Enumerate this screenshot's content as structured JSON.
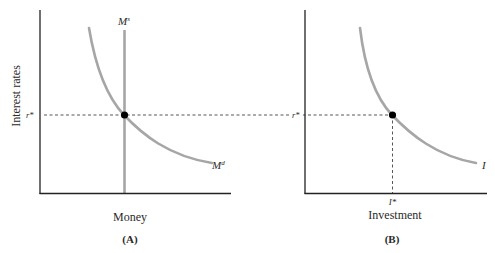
{
  "panel_a": {
    "caption": "(A)",
    "x_label": "Money",
    "y_label": "Interest rates",
    "equilibrium_rate_label": "r*",
    "supply_curve_label": "M",
    "supply_curve_sup": "s",
    "demand_curve_label": "M",
    "demand_curve_sup": "d"
  },
  "panel_b": {
    "caption": "(B)",
    "x_label": "Investment",
    "equilibrium_rate_label": "r*",
    "equilibrium_investment_label": "I*",
    "investment_curve_label": "I"
  },
  "colors": {
    "axis": "#222222",
    "curve": "#a6a6a6",
    "dashed": "#444444",
    "point": "#000000"
  }
}
